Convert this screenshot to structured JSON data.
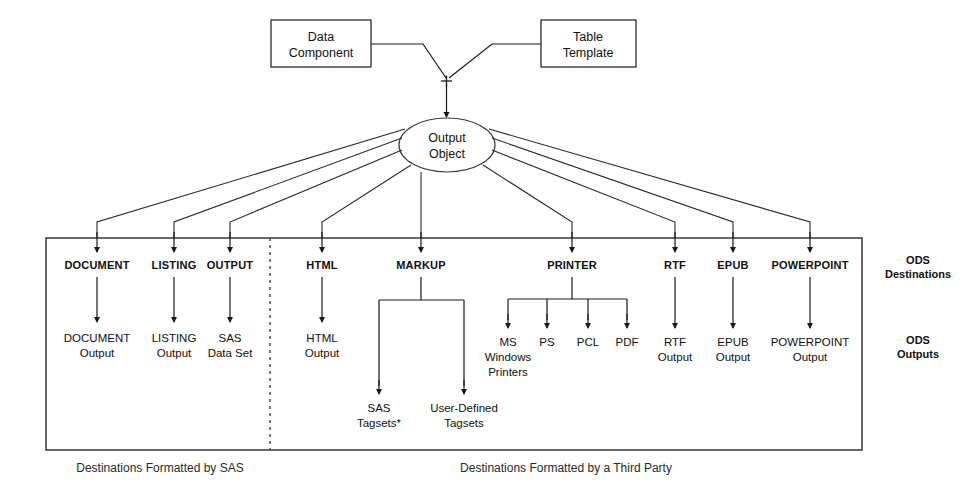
{
  "diagram": {
    "colors": {
      "line": "#1a1a1a",
      "text": "#111111",
      "background": "#ffffff",
      "dashed_divider": "#444444"
    },
    "sources": [
      {
        "id": "data-component",
        "line1": "Data",
        "line2": "Component"
      },
      {
        "id": "table-template",
        "line1": "Table",
        "line2": "Template"
      }
    ],
    "combiner_symbol": "+",
    "output_object": {
      "line1": "Output",
      "line2": "Object"
    },
    "destinations": [
      {
        "id": "document",
        "label": "DOCUMENT"
      },
      {
        "id": "listing",
        "label": "LISTING"
      },
      {
        "id": "output",
        "label": "OUTPUT"
      },
      {
        "id": "html",
        "label": "HTML"
      },
      {
        "id": "markup",
        "label": "MARKUP"
      },
      {
        "id": "printer",
        "label": "PRINTER"
      },
      {
        "id": "rtf",
        "label": "RTF"
      },
      {
        "id": "epub",
        "label": "EPUB"
      },
      {
        "id": "powerpoint",
        "label": "POWERPOINT"
      }
    ],
    "outputs": [
      {
        "id": "document-output",
        "line1": "DOCUMENT",
        "line2": "Output"
      },
      {
        "id": "listing-output",
        "line1": "LISTING",
        "line2": "Output"
      },
      {
        "id": "sas-data-set",
        "line1": "SAS",
        "line2": "Data Set"
      },
      {
        "id": "html-output",
        "line1": "HTML",
        "line2": "Output"
      },
      {
        "id": "rtf-output",
        "line1": "RTF",
        "line2": "Output"
      },
      {
        "id": "epub-output",
        "line1": "EPUB",
        "line2": "Output"
      },
      {
        "id": "powerpoint-output",
        "line1": "POWERPOINT",
        "line2": "Output"
      }
    ],
    "markup_children": [
      {
        "id": "sas-tagsets",
        "line1": "SAS",
        "line2": "Tagsets*"
      },
      {
        "id": "user-defined-tagsets",
        "line1": "User-Defined",
        "line2": "Tagsets"
      }
    ],
    "printer_children": [
      {
        "id": "ms-windows-printers",
        "line1": "MS",
        "line2": "Windows",
        "line3": "Printers"
      },
      {
        "id": "ps",
        "line1": "PS",
        "line2": "",
        "line3": ""
      },
      {
        "id": "pcl",
        "line1": "PCL",
        "line2": "",
        "line3": ""
      },
      {
        "id": "pdf",
        "line1": "PDF",
        "line2": "",
        "line3": ""
      }
    ],
    "side_labels": [
      {
        "id": "ods-destinations",
        "line1": "ODS",
        "line2": "Destinations"
      },
      {
        "id": "ods-outputs",
        "line1": "ODS",
        "line2": "Outputs"
      }
    ],
    "captions": [
      {
        "id": "caption-sas",
        "text": "Destinations Formatted by SAS"
      },
      {
        "id": "caption-third-party",
        "text": "Destinations Formatted by a Third Party"
      }
    ]
  }
}
